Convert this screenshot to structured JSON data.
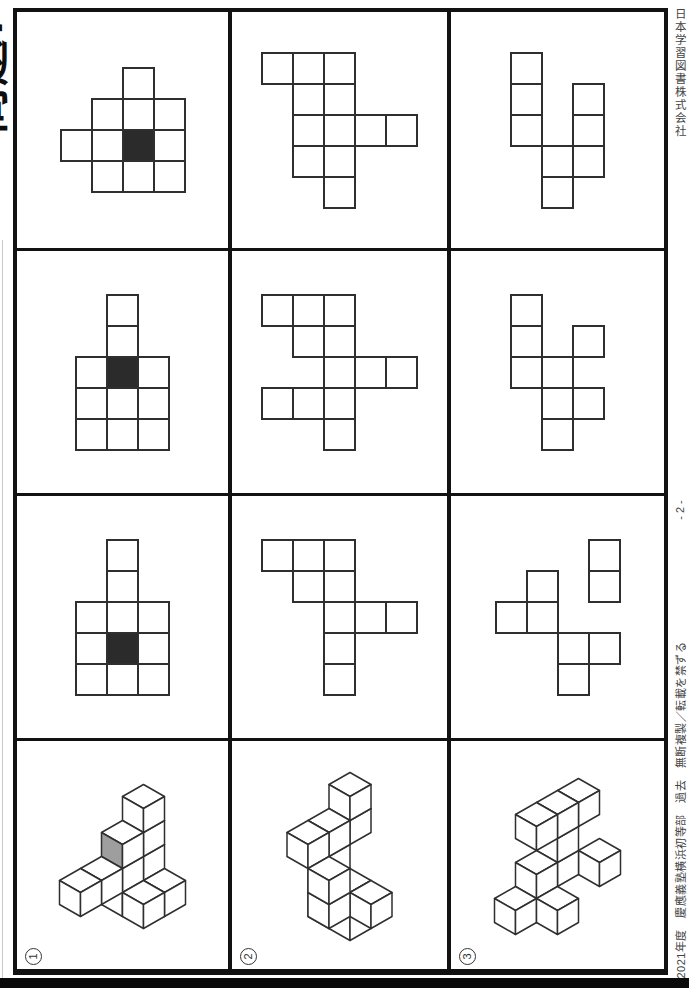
{
  "document": {
    "title": "問題7",
    "publisher": "日本学習図書株式会社",
    "page_number": "- 2 -",
    "copyright": "2021年度　慶應義塾横浜初等部　過去　無断複製／転載を禁ずる"
  },
  "colors": {
    "line": "#2f2f2f",
    "border": "#121212",
    "black_square": "#2b2b2b",
    "gray_face": "#9e9e9e",
    "paper": "#ffffff"
  },
  "labels": [
    "1",
    "2",
    "3"
  ],
  "grid": {
    "columns": 3,
    "rows": 4
  },
  "cells_2d": [
    {
      "row": 1,
      "col": 1,
      "squares": [
        [
          2,
          0
        ],
        [
          1,
          1
        ],
        [
          2,
          1
        ],
        [
          3,
          1
        ],
        [
          0,
          2
        ],
        [
          1,
          2
        ],
        [
          2,
          2
        ],
        [
          3,
          2
        ],
        [
          1,
          3
        ],
        [
          2,
          3
        ],
        [
          3,
          3
        ]
      ],
      "black": [
        2,
        2
      ]
    },
    {
      "row": 2,
      "col": 1,
      "squares": [
        [
          1,
          0
        ],
        [
          1,
          1
        ],
        [
          0,
          2
        ],
        [
          1,
          2
        ],
        [
          2,
          2
        ],
        [
          0,
          3
        ],
        [
          1,
          3
        ],
        [
          2,
          3
        ],
        [
          0,
          4
        ],
        [
          1,
          4
        ],
        [
          2,
          4
        ]
      ],
      "black": [
        1,
        2
      ]
    },
    {
      "row": 3,
      "col": 1,
      "squares": [
        [
          1,
          0
        ],
        [
          1,
          1
        ],
        [
          0,
          2
        ],
        [
          1,
          2
        ],
        [
          2,
          2
        ],
        [
          0,
          3
        ],
        [
          1,
          3
        ],
        [
          2,
          3
        ],
        [
          0,
          4
        ],
        [
          1,
          4
        ],
        [
          2,
          4
        ]
      ],
      "black": [
        1,
        3
      ]
    },
    {
      "row": 1,
      "col": 2,
      "squares": [
        [
          0,
          0
        ],
        [
          1,
          0
        ],
        [
          2,
          0
        ],
        [
          1,
          1
        ],
        [
          2,
          1
        ],
        [
          1,
          2
        ],
        [
          2,
          2
        ],
        [
          3,
          2
        ],
        [
          4,
          2
        ],
        [
          1,
          3
        ],
        [
          2,
          3
        ],
        [
          2,
          4
        ]
      ],
      "black": null
    },
    {
      "row": 2,
      "col": 2,
      "squares": [
        [
          0,
          0
        ],
        [
          1,
          0
        ],
        [
          2,
          0
        ],
        [
          1,
          1
        ],
        [
          2,
          1
        ],
        [
          2,
          2
        ],
        [
          3,
          2
        ],
        [
          4,
          2
        ],
        [
          0,
          3
        ],
        [
          1,
          3
        ],
        [
          2,
          3
        ],
        [
          2,
          4
        ]
      ],
      "black": null
    },
    {
      "row": 3,
      "col": 2,
      "squares": [
        [
          0,
          0
        ],
        [
          1,
          0
        ],
        [
          2,
          0
        ],
        [
          1,
          1
        ],
        [
          2,
          1
        ],
        [
          2,
          2
        ],
        [
          3,
          2
        ],
        [
          4,
          2
        ],
        [
          2,
          3
        ],
        [
          2,
          4
        ]
      ],
      "black": null
    },
    {
      "row": 1,
      "col": 3,
      "squares": [
        [
          0,
          0
        ],
        [
          0,
          1
        ],
        [
          2,
          1
        ],
        [
          0,
          2
        ],
        [
          2,
          2
        ],
        [
          1,
          3
        ],
        [
          2,
          3
        ],
        [
          1,
          4
        ]
      ],
      "black": null
    },
    {
      "row": 2,
      "col": 3,
      "squares": [
        [
          0,
          0
        ],
        [
          0,
          1
        ],
        [
          2,
          1
        ],
        [
          0,
          2
        ],
        [
          1,
          2
        ],
        [
          1,
          3
        ],
        [
          2,
          3
        ],
        [
          1,
          4
        ]
      ],
      "black": null
    },
    {
      "row": 3,
      "col": 3,
      "squares": [
        [
          3,
          0
        ],
        [
          1,
          1
        ],
        [
          3,
          1
        ],
        [
          0,
          2
        ],
        [
          1,
          2
        ],
        [
          2,
          3
        ],
        [
          3,
          3
        ],
        [
          2,
          4
        ]
      ],
      "black": null
    }
  ],
  "figures_3d": [
    {
      "number": "1",
      "cubes": [
        [
          1,
          0,
          3
        ],
        [
          1,
          0,
          2
        ],
        [
          1,
          1,
          2
        ],
        [
          1,
          2,
          1
        ],
        [
          1,
          3,
          1
        ],
        [
          1,
          1,
          1
        ],
        [
          1,
          0,
          1
        ],
        [
          1,
          1,
          0
        ],
        [
          1,
          0,
          0
        ],
        [
          2,
          0,
          0
        ],
        [
          2,
          1,
          0
        ]
      ],
      "gray_cube_index": 2,
      "gray_face": "left"
    },
    {
      "number": "2",
      "cubes": [
        [
          0,
          0,
          4
        ],
        [
          0,
          0,
          3
        ],
        [
          0,
          1,
          3
        ],
        [
          0,
          2,
          3
        ],
        [
          0,
          1,
          2
        ],
        [
          1,
          2,
          2
        ],
        [
          0,
          1,
          1
        ],
        [
          1,
          1,
          1
        ],
        [
          2,
          1,
          1
        ],
        [
          1,
          2,
          1
        ],
        [
          0,
          1,
          0
        ],
        [
          1,
          1,
          0
        ]
      ],
      "gray_cube_index": -1,
      "gray_face": ""
    },
    {
      "number": "3",
      "cubes": [
        [
          1,
          0,
          3
        ],
        [
          1,
          1,
          3
        ],
        [
          1,
          2,
          3
        ],
        [
          1,
          1,
          2
        ],
        [
          2,
          0,
          1
        ],
        [
          1,
          1,
          1
        ],
        [
          1,
          2,
          1
        ],
        [
          1,
          2,
          0
        ],
        [
          1,
          3,
          0
        ],
        [
          2,
          2,
          0
        ]
      ],
      "gray_cube_index": -1,
      "gray_face": ""
    }
  ]
}
